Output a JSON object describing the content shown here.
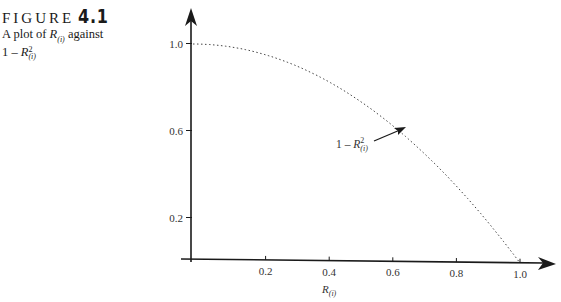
{
  "figure": {
    "label_word": "FIGURE",
    "label_number": "4.1",
    "caption_line1_prefix": "A plot of ",
    "caption_line1_var": "R",
    "caption_line1_sub": "(i)",
    "caption_line1_suffix": " against",
    "caption_line2_prefix": "1 – ",
    "caption_line2_var": "R",
    "caption_line2_sup": "2",
    "caption_line2_sub": "(i)"
  },
  "chart_data": {
    "type": "line",
    "xlabel": "R(i)",
    "ylabel": "",
    "xlim": [
      0,
      1.0
    ],
    "ylim": [
      0,
      1.0
    ],
    "x_ticks": [
      "0.2",
      "0.4",
      "0.6",
      "0.8",
      "1.0"
    ],
    "y_ticks": [
      "0.2",
      "0.6",
      "1.0"
    ],
    "grid": false,
    "legend": null,
    "series": [
      {
        "name": "1 - R(i)^2",
        "style": "dotted",
        "x": [
          0,
          0.1,
          0.2,
          0.3,
          0.4,
          0.5,
          0.6,
          0.7,
          0.8,
          0.9,
          1.0
        ],
        "y": [
          1.0,
          0.99,
          0.96,
          0.91,
          0.84,
          0.75,
          0.64,
          0.51,
          0.36,
          0.19,
          0.0
        ]
      }
    ],
    "annotations": [
      {
        "text": "1 - R(i)^2",
        "arrow_to": [
          0.65,
          0.58
        ]
      }
    ]
  },
  "axis": {
    "x_ticks": [
      "0.2",
      "0.4",
      "0.6",
      "0.8",
      "1.0"
    ],
    "y_ticks": [
      "1.0",
      "0.6",
      "0.2"
    ],
    "x_title_var": "R",
    "x_title_sub": "(i)"
  },
  "annotation": {
    "prefix": "1 – ",
    "var": "R",
    "sup": "2",
    "sub": "(i)"
  }
}
